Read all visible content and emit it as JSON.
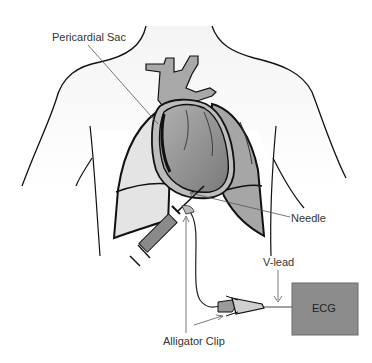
{
  "diagram": {
    "labels": {
      "pericardial_sac": "Pericardial Sac",
      "needle": "Needle",
      "v_lead": "V-lead",
      "alligator_clip": "Alligator Clip",
      "ecg": "ECG"
    },
    "colors": {
      "background": "#ffffff",
      "body_fill": "#f2f2f2",
      "outline": "#111111",
      "heart_fill": "#9a9a9a",
      "lung_fill": "#b8b8b8",
      "vessel_fill": "#a8a8a8",
      "ecg_box": "#8c8c8c",
      "leader_line": "#555555"
    }
  }
}
